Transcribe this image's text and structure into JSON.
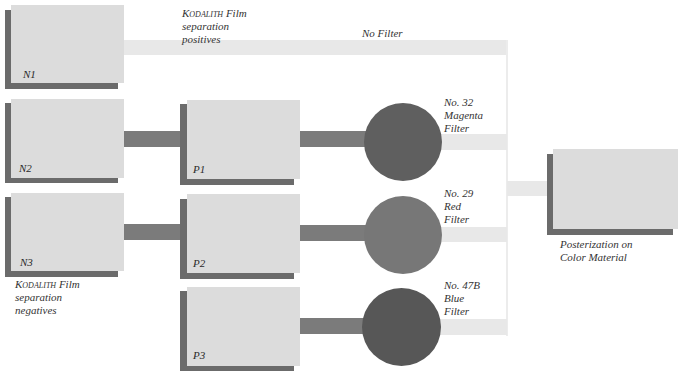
{
  "diagram": {
    "colors": {
      "card_fill": "#dcdcdc",
      "card_shadow": "#6b6b6b",
      "connector_dark": "#7b7b7b",
      "connector_light": "#e8e8e8",
      "filter_magenta": "#5f5f5f",
      "filter_red": "#777777",
      "filter_blue": "#575757"
    },
    "negatives": [
      {
        "id": "N1",
        "label": "N1"
      },
      {
        "id": "N2",
        "label": "N2"
      },
      {
        "id": "N3",
        "label": "N3"
      }
    ],
    "positives": [
      {
        "id": "P1",
        "label": "P1"
      },
      {
        "id": "P2",
        "label": "P2"
      },
      {
        "id": "P3",
        "label": "P3"
      }
    ],
    "captions": {
      "positives": {
        "brand": "Kodalith",
        "line1_rest": " Film",
        "line2": "separation",
        "line3": "positives"
      },
      "negatives": {
        "brand": "Kodalith",
        "line1_rest": " Film",
        "line2": "separation",
        "line3": "negatives"
      },
      "no_filter": "No Filter",
      "output": {
        "line1": "Posterization on",
        "line2": "Color Material"
      }
    },
    "filters": [
      {
        "line1": "No. 32",
        "line2": "Magenta",
        "line3": "Filter"
      },
      {
        "line1": "No. 29",
        "line2": "Red",
        "line3": "Filter"
      },
      {
        "line1": "No. 47B",
        "line2": "Blue",
        "line3": "Filter"
      }
    ]
  }
}
